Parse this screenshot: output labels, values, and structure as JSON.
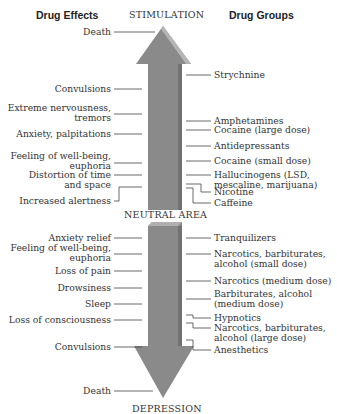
{
  "headers": {
    "left": "Drug Effects",
    "right": "Drug Groups"
  },
  "axis": {
    "top": "STIMULATION",
    "middle": "NEUTRAL AREA",
    "bottom": "DEPRESSION"
  },
  "colors": {
    "arrow_fill": "#8a8a8a",
    "arrow_bevel": "#b3b3b3",
    "arrow_shadow": "#6f6f6f",
    "leader_line": "#444444"
  },
  "stimulation": {
    "effects": [
      {
        "label": "Death"
      },
      {
        "label": "Convulsions"
      },
      {
        "label": "Extreme nervousness,",
        "label2": "tremors"
      },
      {
        "label": "Anxiety, palpitations"
      },
      {
        "label": "Feeling of well-being,",
        "label2": "euphoria"
      },
      {
        "label": "Distortion of time",
        "label2": "and space"
      },
      {
        "label": "Increased alertness"
      }
    ],
    "drugs": [
      {
        "label": "Strychnine"
      },
      {
        "label": "Amphetamines"
      },
      {
        "label": "Cocaine (large dose)"
      },
      {
        "label": "Antidepressants"
      },
      {
        "label": "Cocaine (small dose)"
      },
      {
        "label": "Hallucinogens (LSD,",
        "label2": "mescaline, marijuana)"
      },
      {
        "label": "Nicotine"
      },
      {
        "label": "Caffeine"
      }
    ]
  },
  "depression": {
    "effects": [
      {
        "label": "Anxiety relief"
      },
      {
        "label": "Feeling of well-being,",
        "label2": "euphoria"
      },
      {
        "label": "Loss of pain"
      },
      {
        "label": "Drowsiness"
      },
      {
        "label": "Sleep"
      },
      {
        "label": "Loss of consciousness"
      },
      {
        "label": "Convulsions"
      },
      {
        "label": "Death"
      }
    ],
    "drugs": [
      {
        "label": "Tranquilizers"
      },
      {
        "label": "Narcotics, barbiturates,",
        "label2": "alcohol (small dose)"
      },
      {
        "label": "Narcotics (medium dose)"
      },
      {
        "label": "Barbiturates, alcohol",
        "label2": "(medium dose)"
      },
      {
        "label": "Hypnotics"
      },
      {
        "label": "Narcotics, barbiturates,",
        "label2": "alcohol (large dose)"
      },
      {
        "label": "Anesthetics"
      }
    ]
  }
}
